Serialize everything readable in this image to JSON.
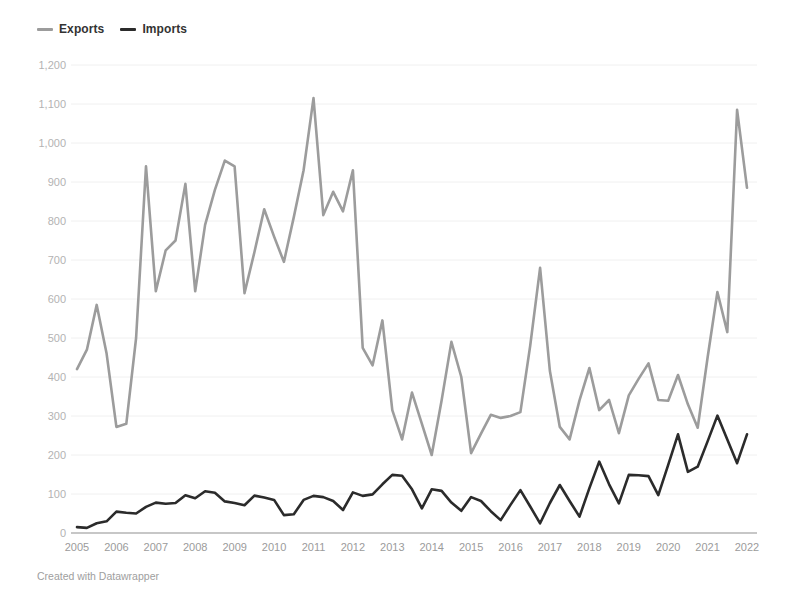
{
  "legend": {
    "items": [
      {
        "label": "Exports",
        "color": "#9c9c9c"
      },
      {
        "label": "Imports",
        "color": "#2b2b2b"
      }
    ]
  },
  "footer": {
    "text": "Created with Datawrapper"
  },
  "colors": {
    "grid": "#f0f0f0",
    "baseline": "#8f8f8f",
    "y_tick_text": "#b3b3b3",
    "x_tick_text": "#9b9b9b"
  },
  "chart_data": {
    "type": "line",
    "title": "",
    "xlabel": "",
    "ylabel": "",
    "ylim": [
      0,
      1200
    ],
    "y_tick_step": 100,
    "y_tick_labels": [
      "0",
      "100",
      "200",
      "300",
      "400",
      "500",
      "600",
      "700",
      "800",
      "900",
      "1,000",
      "1,100",
      "1,200"
    ],
    "x_tick_labels": [
      "2005",
      "2006",
      "2007",
      "2008",
      "2009",
      "2010",
      "2011",
      "2012",
      "2013",
      "2014",
      "2015",
      "2016",
      "2017",
      "2018",
      "2019",
      "2020",
      "2021",
      "2022"
    ],
    "x_unit": "quarterly points from 2005 Q1 to 2022 Q1",
    "grid": "horizontal gridlines on, very light; solid darker baseline at 0",
    "legend_position": "top-left",
    "series": [
      {
        "name": "Exports",
        "color": "#9c9c9c",
        "values": [
          420,
          470,
          585,
          460,
          272,
          280,
          500,
          940,
          620,
          725,
          750,
          895,
          620,
          790,
          880,
          955,
          940,
          615,
          720,
          830,
          760,
          695,
          810,
          930,
          1115,
          815,
          875,
          825,
          930,
          475,
          430,
          545,
          315,
          240,
          360,
          280,
          200,
          340,
          490,
          400,
          205,
          255,
          303,
          295,
          300,
          310,
          480,
          680,
          415,
          272,
          240,
          340,
          423,
          315,
          341,
          256,
          353,
          395,
          435,
          341,
          339,
          405,
          330,
          270,
          450,
          618,
          515,
          1085,
          885
        ]
      },
      {
        "name": "Imports",
        "color": "#2b2b2b",
        "values": [
          15,
          13,
          25,
          30,
          55,
          52,
          50,
          67,
          78,
          75,
          77,
          97,
          89,
          107,
          103,
          81,
          77,
          71,
          96,
          91,
          85,
          46,
          48,
          85,
          95,
          92,
          82,
          59,
          104,
          95,
          99,
          125,
          149,
          147,
          112,
          63,
          112,
          108,
          78,
          57,
          92,
          82,
          56,
          33,
          72,
          110,
          68,
          25,
          77,
          123,
          82,
          42,
          115,
          183,
          125,
          76,
          149,
          148,
          146,
          97,
          175,
          253,
          157,
          170,
          235,
          301,
          240,
          179,
          253
        ]
      }
    ]
  }
}
